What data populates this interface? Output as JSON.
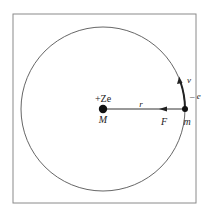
{
  "diagram": {
    "type": "bohr-atom-orbit",
    "nucleus": {
      "charge_label": "+Ze",
      "mass_label": "M"
    },
    "electron": {
      "charge_label": "– e",
      "mass_label": "m",
      "velocity_label": "v"
    },
    "radius_label": "r",
    "force_label": "F",
    "colors": {
      "stroke": "#333333",
      "frame": "#888888",
      "background": "#ffffff"
    }
  }
}
